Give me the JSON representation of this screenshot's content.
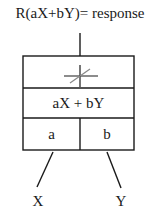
{
  "diagram": {
    "title": "R(aX+bY)= response",
    "box": {
      "top_cell_symbol": "summation-threshold-icon",
      "middle_cell": "aX + bY",
      "bottom_cells": [
        "a",
        "b"
      ]
    },
    "inputs": [
      "X",
      "Y"
    ],
    "colors": {
      "stroke": "#1a1a1a",
      "diagonal": "#888888",
      "background": "#ffffff"
    }
  }
}
